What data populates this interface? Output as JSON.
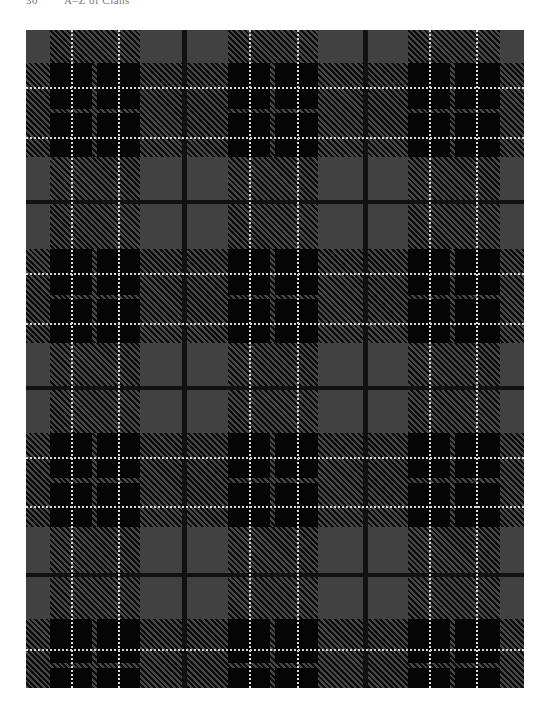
{
  "page": {
    "page_number": "30",
    "running_title": "A–Z of Clans"
  },
  "tartan": {
    "description": "Grey and black tartan with white overcheck",
    "colors": {
      "ground": "#414141",
      "black": "#050505",
      "white": "#d8d8d8"
    },
    "width": 498,
    "height": 658,
    "vertical_bands": [
      {
        "start": 24,
        "end": 114,
        "gap": [
          66,
          71
        ],
        "whites": [
          45,
          92
        ]
      },
      {
        "start": 202,
        "end": 292,
        "gap": [
          244,
          249
        ],
        "whites": [
          223,
          271
        ]
      },
      {
        "start": 382,
        "end": 474,
        "gap": [
          424,
          429
        ],
        "whites": [
          403,
          450
        ]
      }
    ],
    "vertical_thin_lines": [
      156,
      337
    ],
    "horizontal_bands": [
      {
        "start": 33,
        "end": 127,
        "gap": [
          79,
          83
        ],
        "whites": [
          57,
          107
        ]
      },
      {
        "start": 219,
        "end": 313,
        "gap": [
          265,
          269
        ],
        "whites": [
          243,
          293
        ]
      },
      {
        "start": 403,
        "end": 497,
        "gap": [
          448,
          453
        ],
        "whites": [
          427,
          476
        ]
      },
      {
        "start": 589,
        "end": 683,
        "gap": [
          633,
          638
        ],
        "whites": [
          619,
          668
        ]
      }
    ],
    "horizontal_thin_lines": [
      170,
      356,
      543
    ]
  }
}
